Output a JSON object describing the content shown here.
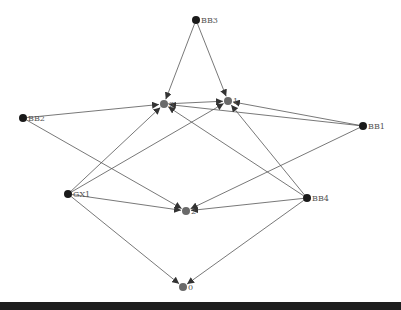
{
  "diagram": {
    "type": "directed-graph",
    "colors": {
      "source_node": "#1a1a1a",
      "target_node": "#6a6a6a",
      "edge": "#555555",
      "label": "#555555",
      "bottom_bar": "#1e1e1e"
    },
    "nodes": [
      {
        "id": "BB3",
        "label": "BB3",
        "x": 196,
        "y": 20,
        "kind": "source"
      },
      {
        "id": "3",
        "label": "3",
        "x": 164,
        "y": 104,
        "kind": "target"
      },
      {
        "id": "1",
        "label": "1",
        "x": 228,
        "y": 101,
        "kind": "target"
      },
      {
        "id": "BB2",
        "label": "BB2",
        "x": 23,
        "y": 118,
        "kind": "source"
      },
      {
        "id": "BB1",
        "label": "BB1",
        "x": 363,
        "y": 126,
        "kind": "source"
      },
      {
        "id": "GX1",
        "label": "GX1",
        "x": 68,
        "y": 194,
        "kind": "source"
      },
      {
        "id": "2",
        "label": "2",
        "x": 186,
        "y": 211,
        "kind": "target"
      },
      {
        "id": "BB4",
        "label": "BB4",
        "x": 307,
        "y": 198,
        "kind": "source"
      },
      {
        "id": "0",
        "label": "0",
        "x": 183,
        "y": 287,
        "kind": "target"
      }
    ],
    "edges": [
      {
        "from": "BB3",
        "to": "3"
      },
      {
        "from": "BB3",
        "to": "1"
      },
      {
        "from": "BB2",
        "to": "3"
      },
      {
        "from": "BB2",
        "to": "2"
      },
      {
        "from": "3",
        "to": "1"
      },
      {
        "from": "BB1",
        "to": "1"
      },
      {
        "from": "BB1",
        "to": "3"
      },
      {
        "from": "BB1",
        "to": "2"
      },
      {
        "from": "GX1",
        "to": "3"
      },
      {
        "from": "GX1",
        "to": "1"
      },
      {
        "from": "GX1",
        "to": "2"
      },
      {
        "from": "GX1",
        "to": "0"
      },
      {
        "from": "BB4",
        "to": "3"
      },
      {
        "from": "BB4",
        "to": "1"
      },
      {
        "from": "BB4",
        "to": "2"
      },
      {
        "from": "BB4",
        "to": "0"
      }
    ]
  }
}
